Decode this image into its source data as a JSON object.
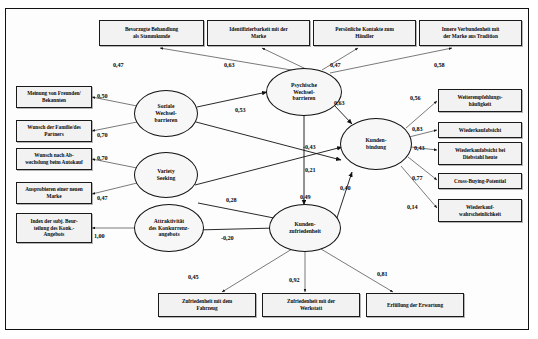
{
  "diagram": {
    "decimal_separator": ",",
    "latents": {
      "psych": "Psychische Wechsel-\nbarrieren",
      "psych_l1": "Psychische",
      "psych_l2": "Wechsel-",
      "psych_l3": "barrieren",
      "sozial_l1": "Soziale",
      "sozial_l2": "Wechsel-",
      "sozial_l3": "barrieren",
      "variety_l1": "Variety",
      "variety_l2": "Seeking",
      "attrakt_l1": "Attraktivität",
      "attrakt_l2": "des Konkurrenz-",
      "attrakt_l3": "angebots",
      "bindung_l1": "Kunden-",
      "bindung_l2": "bindung",
      "zufrieden_l1": "Kunden-",
      "zufrieden_l2": "zufriedenheit"
    },
    "indicators_top": [
      {
        "id": "top-1",
        "line1": "Bevorzugte Behandlung",
        "line2": "als Stammkunde",
        "loading": "0,47"
      },
      {
        "id": "top-2",
        "line1": "Identifizierbarkeit mit der",
        "line2": "Marke",
        "loading": "0,63"
      },
      {
        "id": "top-3",
        "line1": "Persönliche Kontakte zum",
        "line2": "Händler",
        "loading": "0,47"
      },
      {
        "id": "top-4",
        "line1": "Innere Verbundenheit mit",
        "line2": "der Marke aus Tradition",
        "loading": "0,58"
      }
    ],
    "indicators_left": [
      {
        "id": "left-1",
        "line1": "Meinung von Freunden/",
        "line2": "Bekannten",
        "loading": "0,50"
      },
      {
        "id": "left-2",
        "line1": "Wunsch der Familie/des",
        "line2": "Partners",
        "loading": "0,70"
      },
      {
        "id": "left-3",
        "line1": "Wunsch nach Ab-",
        "line2": "wechslung beim Autokauf",
        "loading": "0,70"
      },
      {
        "id": "left-4",
        "line1": "Ausprobieren einer neuen",
        "line2": "Marke",
        "loading": "0,47"
      },
      {
        "id": "left-5",
        "line1": "Index der subj. Beur-",
        "line2": "teilung des Konk.-",
        "line3": "Angebots",
        "loading": "1,00"
      }
    ],
    "indicators_right": [
      {
        "id": "right-1",
        "line1": "Weiterempfehlungs-",
        "line2": "häufigkeit",
        "loading": "0,56"
      },
      {
        "id": "right-2",
        "line1": "Wiederkaufabsicht",
        "line2": "",
        "loading": "0,83"
      },
      {
        "id": "right-3",
        "line1": "Wiederkaufabsicht bei",
        "line2": "Diebstahl heute",
        "loading": "0,43"
      },
      {
        "id": "right-4",
        "line1": "Cross-Buying-Potential",
        "line2": "",
        "loading": "0,77"
      },
      {
        "id": "right-5",
        "line1": "Wiederkauf-",
        "line2": "wahrscheinlichkeit",
        "loading": "0,14"
      }
    ],
    "indicators_bottom": [
      {
        "id": "bottom-1",
        "line1": "Zufriedenheit mit dem",
        "line2": "Fahrzeug",
        "loading": "0,45"
      },
      {
        "id": "bottom-2",
        "line1": "Zufriedenheit mit der",
        "line2": "Werkstatt",
        "loading": "0,92"
      },
      {
        "id": "bottom-3",
        "line1": "Erfüllung der Erwartung",
        "line2": "",
        "loading": "0,81"
      }
    ],
    "paths": {
      "sozial_to_psych": "0,53",
      "psych_to_bindung": "0,63",
      "variety_to_bindung": "-0,43",
      "sozial_to_bindung": "0,21",
      "attrakt_to_zufrieden": "-0,20",
      "variety_to_zufrieden": "0,28",
      "psych_to_zufrieden": "0,49",
      "zufrieden_to_bindung": "0,40"
    }
  }
}
